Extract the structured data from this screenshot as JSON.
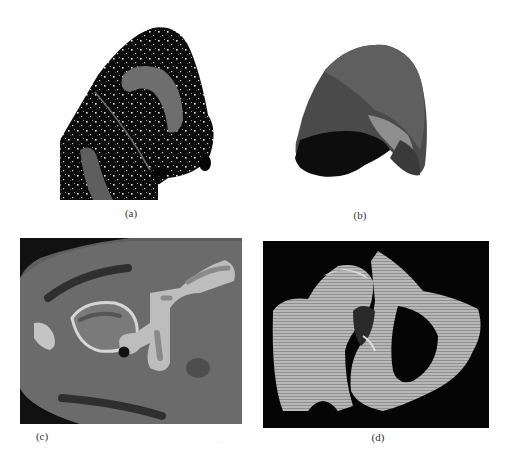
{
  "figure": {
    "panels": [
      {
        "id": "a",
        "caption": "(a)",
        "description": "Segmented lung CT slice: black parenchyma with white vessel speckles, two grey labeled regions and a fissure line"
      },
      {
        "id": "b",
        "caption": "(b)",
        "description": "3D surface rendering of a lung lobe with differently shaded segmented regions"
      },
      {
        "id": "c",
        "caption": "(c)",
        "description": "Axial CT slice of hip/pelvis with bones and dark annotation strokes"
      },
      {
        "id": "d",
        "caption": "(d)",
        "description": "3D volume rendering of femur and pelvic bone on black background"
      }
    ],
    "stray_mark": "· · ·",
    "colors": {
      "background": "#ffffff",
      "lung_black": "#0a0a0a",
      "label_grey": "#6e6e6e",
      "ct_tissue": "#6a6a6a",
      "ct_bone": "#d8d8d8",
      "render_bg": "#050505",
      "render_bone": "#bcbcbc"
    }
  }
}
